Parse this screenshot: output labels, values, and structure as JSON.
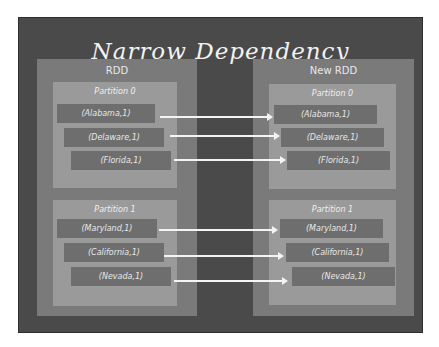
{
  "title": "Narrow Dependency",
  "colors": {
    "background_frame": "#4a4a4a",
    "rdd_box": "#7a7a7a",
    "partition_box": "#9a9a9a",
    "record_box": "#6e6e6e",
    "text": "#f2f2f2",
    "arrow": "#f4f4f4"
  },
  "left": {
    "label": "RDD",
    "partitions": [
      {
        "label": "Partition 0",
        "records": [
          "(Alabama,1)",
          "(Delaware,1)",
          "(Florida,1)"
        ]
      },
      {
        "label": "Partition 1",
        "records": [
          "(Maryland,1)",
          "(California,1)",
          "(Nevada,1)"
        ]
      }
    ]
  },
  "right": {
    "label": "New RDD",
    "partitions": [
      {
        "label": "Partition 0",
        "records": [
          "(Alabama,1)",
          "(Delaware,1)",
          "(Florida,1)"
        ]
      },
      {
        "label": "Partition 1",
        "records": [
          "(Maryland,1)",
          "(California,1)",
          "(Nevada,1)"
        ]
      }
    ]
  }
}
